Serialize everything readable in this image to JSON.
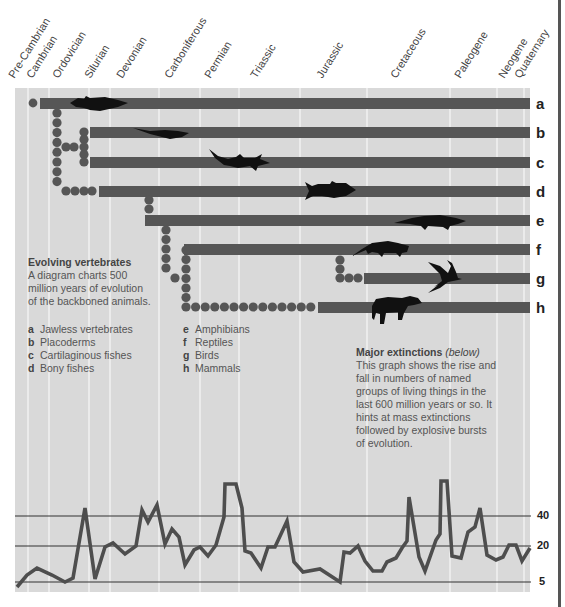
{
  "periods": [
    {
      "label": "Pre-Cambrian",
      "x": 22
    },
    {
      "label": "Cambrian",
      "x": 40
    },
    {
      "label": "Ordovician",
      "x": 66
    },
    {
      "label": "Silurian",
      "x": 98
    },
    {
      "label": "Devonian",
      "x": 130
    },
    {
      "label": "Carboniferous",
      "x": 178
    },
    {
      "label": "Permian",
      "x": 218
    },
    {
      "label": "Triassic",
      "x": 264
    },
    {
      "label": "Jurassic",
      "x": 330
    },
    {
      "label": "Cretaceous",
      "x": 404
    },
    {
      "label": "Paleogene",
      "x": 468
    },
    {
      "label": "Neogene",
      "x": 512
    },
    {
      "label": "Quaternary",
      "x": 528
    }
  ],
  "rows": [
    {
      "letter": "a",
      "name": "Jawless vertebrates"
    },
    {
      "letter": "b",
      "name": "Placoderms"
    },
    {
      "letter": "c",
      "name": "Cartilaginous fishes"
    },
    {
      "letter": "d",
      "name": "Bony fishes"
    },
    {
      "letter": "e",
      "name": "Amphibians"
    },
    {
      "letter": "f",
      "name": "Reptiles"
    },
    {
      "letter": "g",
      "name": "Birds"
    },
    {
      "letter": "h",
      "name": "Mammals"
    }
  ],
  "intro": {
    "title": "Evolving vertebrates",
    "lines": [
      "A diagram charts 500",
      "million years of evolution",
      "of the backboned animals."
    ]
  },
  "extinctions": {
    "title": "Major extinctions",
    "title_note": "(below)",
    "lines": [
      "This graph shows the rise and",
      "fall in numbers of named",
      "groups of living things in the",
      "last 600 million years or so. It",
      "hints at mass extinctions",
      "followed by explosive bursts",
      "of evolution."
    ]
  },
  "colors": {
    "panel": "#d9d9d9",
    "bar": "#555555",
    "gridline": "#f2f2f2",
    "silhouette": "#111111",
    "text": "#4a4a4a"
  },
  "chart_data": {
    "type": "line",
    "title": "Major extinctions",
    "xlabel": "",
    "ylabel": "Number of named groups",
    "y_ticks": [
      5,
      20,
      40
    ],
    "x_range_label": "last 600 million years",
    "grid": true,
    "points_px": [
      [
        17,
        587
      ],
      [
        27,
        575
      ],
      [
        37,
        568
      ],
      [
        52,
        575
      ],
      [
        65,
        582
      ],
      [
        73,
        578
      ],
      [
        85,
        508
      ],
      [
        95,
        579
      ],
      [
        105,
        547
      ],
      [
        113,
        543
      ],
      [
        125,
        554
      ],
      [
        136,
        546
      ],
      [
        142,
        510
      ],
      [
        148,
        522
      ],
      [
        157,
        505
      ],
      [
        165,
        544
      ],
      [
        172,
        529
      ],
      [
        179,
        537
      ],
      [
        185,
        565
      ],
      [
        194,
        550
      ],
      [
        200,
        547
      ],
      [
        208,
        556
      ],
      [
        216,
        545
      ],
      [
        224,
        517
      ],
      [
        225,
        484
      ],
      [
        236,
        484
      ],
      [
        242,
        508
      ],
      [
        245,
        551
      ],
      [
        251,
        553
      ],
      [
        261,
        568
      ],
      [
        268,
        547
      ],
      [
        275,
        547
      ],
      [
        287,
        521
      ],
      [
        294,
        562
      ],
      [
        303,
        572
      ],
      [
        320,
        569
      ],
      [
        340,
        582
      ],
      [
        344,
        552
      ],
      [
        350,
        553
      ],
      [
        358,
        546
      ],
      [
        365,
        561
      ],
      [
        373,
        571
      ],
      [
        382,
        571
      ],
      [
        387,
        562
      ],
      [
        396,
        558
      ],
      [
        402,
        548
      ],
      [
        407,
        541
      ],
      [
        409,
        497
      ],
      [
        419,
        557
      ],
      [
        425,
        571
      ],
      [
        436,
        540
      ],
      [
        440,
        534
      ],
      [
        441,
        481
      ],
      [
        447,
        481
      ],
      [
        452,
        556
      ],
      [
        461,
        558
      ],
      [
        468,
        532
      ],
      [
        475,
        527
      ],
      [
        480,
        508
      ],
      [
        487,
        555
      ],
      [
        496,
        560
      ],
      [
        503,
        557
      ],
      [
        509,
        545
      ],
      [
        516,
        545
      ],
      [
        522,
        561
      ],
      [
        530,
        548
      ]
    ],
    "series": [
      {
        "name": "Families (relative)",
        "values": [
          4,
          8,
          11,
          8,
          5,
          6,
          50,
          6,
          21,
          23,
          17,
          21,
          47,
          37,
          52,
          21,
          30,
          25,
          10,
          18,
          20,
          15,
          21,
          44,
          72,
          72,
          48,
          20,
          19,
          11,
          20,
          20,
          38,
          15,
          9,
          11,
          4,
          18,
          18,
          21,
          13,
          8,
          8,
          12,
          15,
          20,
          26,
          58,
          14,
          8,
          24,
          27,
          76,
          76,
          14,
          13,
          27,
          31,
          47,
          18,
          15,
          16,
          22,
          22,
          13,
          20
        ]
      }
    ]
  }
}
